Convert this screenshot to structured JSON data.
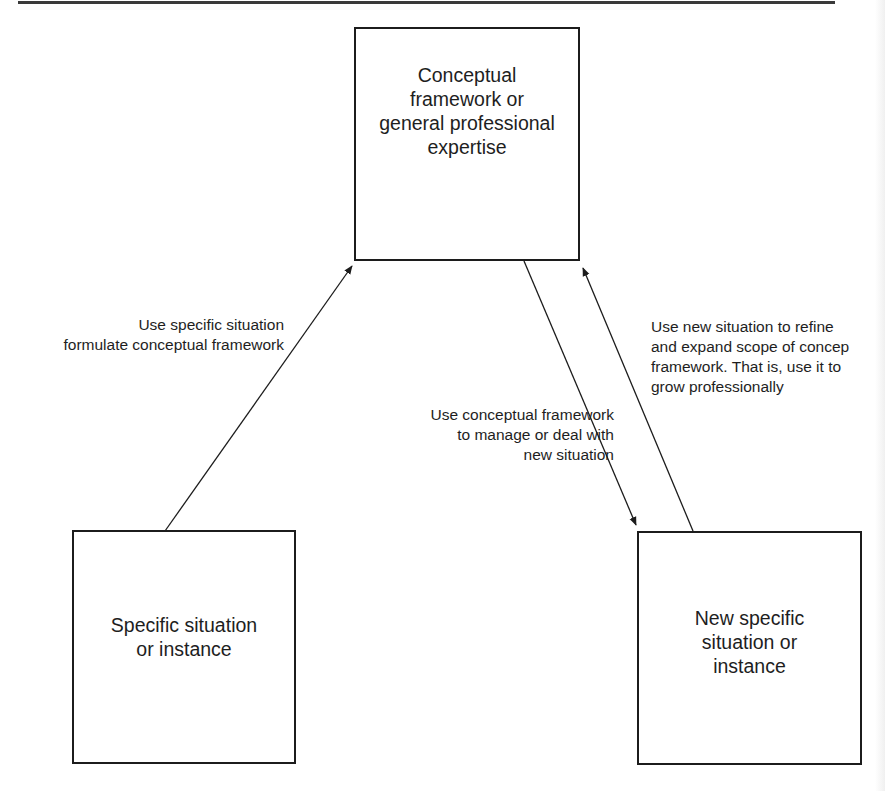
{
  "diagram": {
    "nodes": [
      {
        "id": "framework",
        "label_lines": [
          "Conceptual",
          "framework or",
          "general professional",
          "expertise"
        ]
      },
      {
        "id": "specific",
        "label_lines": [
          "Specific situation",
          "or instance"
        ]
      },
      {
        "id": "new_specific",
        "label_lines": [
          "New specific",
          "situation or",
          "instance"
        ]
      }
    ],
    "edges": [
      {
        "from": "specific",
        "to": "framework",
        "label_lines": [
          "Use specific situation",
          "formulate conceptual framework"
        ]
      },
      {
        "from": "framework",
        "to": "new_specific",
        "label_lines": [
          "Use conceptual framework",
          "to manage or deal with",
          "new situation"
        ]
      },
      {
        "from": "new_specific",
        "to": "framework",
        "label_lines": [
          "Use new situation to refine",
          "and expand scope of concep",
          "framework. That is, use it to",
          "grow professionally"
        ]
      }
    ],
    "colors": {
      "stroke": "#1c1c1c",
      "text": "#1e1e1e",
      "background": "#ffffff"
    }
  }
}
